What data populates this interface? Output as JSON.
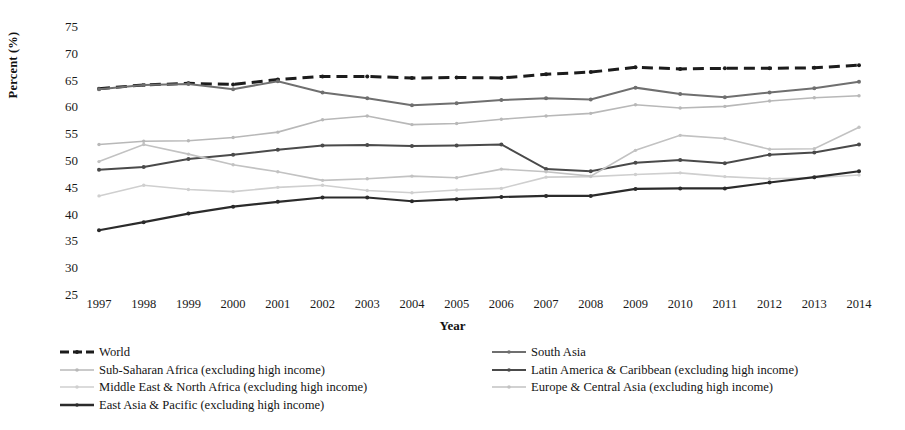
{
  "chart_data": {
    "type": "line",
    "title": "",
    "xlabel": "Year",
    "ylabel": "Percent (%)",
    "ylim": [
      25,
      75
    ],
    "ytick_step": 5,
    "yticks": [
      75,
      70,
      65,
      60,
      55,
      50,
      45,
      40,
      35,
      30,
      25
    ],
    "grid": false,
    "legend_position": "bottom",
    "categories": [
      1997,
      1998,
      1999,
      2000,
      2001,
      2002,
      2003,
      2004,
      2005,
      2006,
      2007,
      2008,
      2009,
      2010,
      2011,
      2012,
      2013,
      2014
    ],
    "series": [
      {
        "name": "World",
        "color": "#1c1c1c",
        "style": "dashed",
        "marker": "circle",
        "width": 3.0,
        "values": [
          63.3,
          64.0,
          64.3,
          64.1,
          65.0,
          65.6,
          65.6,
          65.3,
          65.4,
          65.3,
          66.0,
          66.4,
          67.3,
          67.0,
          67.1,
          67.1,
          67.2,
          67.7
        ]
      },
      {
        "name": "Sub-Saharan Africa (excluding high income)",
        "color": "#b8b8b8",
        "style": "solid",
        "marker": "circle",
        "width": 1.6,
        "values": [
          52.9,
          53.5,
          53.6,
          54.2,
          55.2,
          57.5,
          58.2,
          56.6,
          56.8,
          57.6,
          58.2,
          58.7,
          60.3,
          59.7,
          60.0,
          61.0,
          61.6,
          62.0
        ]
      },
      {
        "name": "Middle East & North Africa (excluding high income)",
        "color": "#cfcfcf",
        "style": "solid",
        "marker": "circle",
        "width": 1.6,
        "values": [
          43.3,
          45.3,
          44.5,
          44.1,
          44.9,
          45.3,
          44.3,
          43.9,
          44.4,
          44.7,
          46.8,
          46.9,
          47.3,
          47.6,
          46.9,
          46.5,
          46.7,
          47.2
        ]
      },
      {
        "name": "East Asia & Pacific (excluding high income)",
        "color": "#2b2b2b",
        "style": "solid",
        "marker": "circle",
        "width": 2.2,
        "values": [
          36.9,
          38.4,
          40.0,
          41.3,
          42.2,
          43.0,
          43.0,
          42.3,
          42.7,
          43.1,
          43.3,
          43.3,
          44.6,
          44.7,
          44.7,
          45.8,
          46.8,
          47.9
        ]
      },
      {
        "name": "South Asia",
        "color": "#6f6f6f",
        "style": "solid",
        "marker": "circle",
        "width": 2.0,
        "values": [
          63.2,
          64.0,
          64.2,
          63.2,
          64.7,
          62.6,
          61.5,
          60.2,
          60.6,
          61.2,
          61.5,
          61.3,
          63.5,
          62.3,
          61.7,
          62.6,
          63.4,
          64.6
        ]
      },
      {
        "name": "Latin America & Caribbean (excluding high income)",
        "color": "#4a4a4a",
        "style": "solid",
        "marker": "circle",
        "width": 2.0,
        "values": [
          48.2,
          48.7,
          50.2,
          51.0,
          51.9,
          52.7,
          52.8,
          52.6,
          52.7,
          52.9,
          48.3,
          47.9,
          49.5,
          50.0,
          49.4,
          51.0,
          51.4,
          52.9
        ]
      },
      {
        "name": "Europe & Central Asia (excluding high income)",
        "color": "#c2c2c2",
        "style": "solid",
        "marker": "circle",
        "width": 1.6,
        "values": [
          49.7,
          52.9,
          51.1,
          49.1,
          47.8,
          46.2,
          46.5,
          47.0,
          46.7,
          48.3,
          47.8,
          47.0,
          51.8,
          54.6,
          54.0,
          52.0,
          52.1,
          56.1
        ]
      }
    ]
  },
  "axes": {
    "ylabel": "Percent (%)",
    "xlabel": "Year"
  },
  "legend": {
    "left_column": [
      {
        "label": "World",
        "color": "#1c1c1c",
        "style": "dashed",
        "width": 3.0
      },
      {
        "label": "Sub-Saharan Africa (excluding high income)",
        "color": "#b8b8b8",
        "style": "solid",
        "width": 1.6
      },
      {
        "label": "Middle East & North Africa (excluding high income)",
        "color": "#cfcfcf",
        "style": "solid",
        "width": 1.6
      },
      {
        "label": "East Asia & Pacific (excluding high income)",
        "color": "#2b2b2b",
        "style": "solid",
        "width": 2.4
      }
    ],
    "right_column": [
      {
        "label": "South Asia",
        "color": "#6f6f6f",
        "style": "solid",
        "width": 2.0
      },
      {
        "label": "Latin America & Caribbean (excluding high income)",
        "color": "#4a4a4a",
        "style": "solid",
        "width": 2.0
      },
      {
        "label": "Europe & Central Asia (excluding high income)",
        "color": "#c2c2c2",
        "style": "solid",
        "width": 1.6
      }
    ]
  }
}
